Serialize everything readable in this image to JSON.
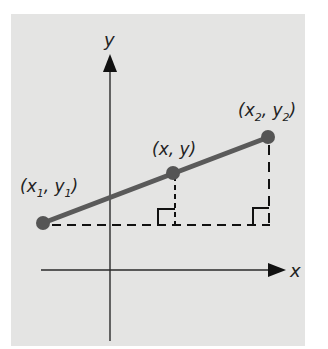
{
  "diagram": {
    "title": "",
    "axes": {
      "x_label": "x",
      "y_label": "y"
    },
    "points": [
      {
        "id": "p1",
        "label_open": "(x",
        "sub1": "1",
        "mid": ", y",
        "sub2": "1",
        "label_close": ")"
      },
      {
        "id": "p",
        "label": "(x, y)"
      },
      {
        "id": "p2",
        "label_open": "(x",
        "sub1": "2",
        "mid": ", y",
        "sub2": "2",
        "label_close": ")"
      }
    ],
    "colors": {
      "background": "#e4e4e3",
      "segment": "#5a5a5a",
      "points": "#555555",
      "axes": "#2a2a2a",
      "dashes": "#111111"
    }
  }
}
